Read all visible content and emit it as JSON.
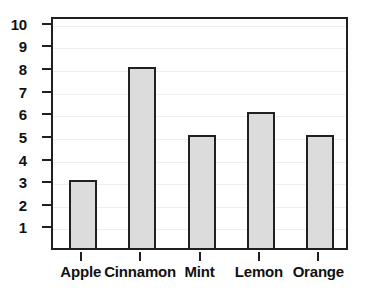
{
  "chart_data": {
    "type": "bar",
    "title": "",
    "xlabel": "",
    "ylabel": "",
    "categories": [
      "Apple",
      "Cinnamon",
      "Mint",
      "Lemon",
      "Orange"
    ],
    "values": [
      3,
      8,
      5,
      6,
      5
    ],
    "ylim": [
      0,
      10.3
    ],
    "yticks": [
      1,
      2,
      3,
      4,
      5,
      6,
      7,
      8,
      9,
      10
    ],
    "ytick_labels": [
      "1",
      "2",
      "3",
      "4",
      "5",
      "6",
      "7",
      "8",
      "9",
      "10"
    ],
    "grid": true,
    "grid_axis": "y",
    "legend": false,
    "bar_fill_color": "#dcdcdc",
    "bar_edge_color": "#231f20",
    "grid_color": "#efefef",
    "frame_color": "#231f20",
    "text_color": "#111111"
  }
}
